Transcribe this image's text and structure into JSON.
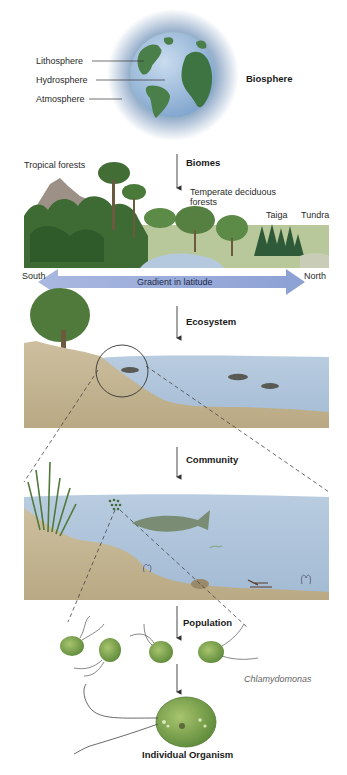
{
  "biosphere": {
    "label": "Biosphere",
    "parts": [
      {
        "label": "Lithosphere"
      },
      {
        "label": "Hydrosphere"
      },
      {
        "label": "Atmosphere"
      }
    ]
  },
  "biomes": {
    "label": "Biomes",
    "types": [
      {
        "label": "Tropical forests"
      },
      {
        "label": "Temperate deciduous forests"
      },
      {
        "label": "Taiga"
      },
      {
        "label": "Tundra"
      }
    ],
    "gradient": {
      "label": "Gradient in latitude",
      "left": "South",
      "right": "North"
    }
  },
  "ecosystem": {
    "label": "Ecosystem"
  },
  "community": {
    "label": "Community"
  },
  "population": {
    "label": "Population",
    "species": "Chlamydomonas"
  },
  "individual": {
    "label": "Individual Organism"
  },
  "colors": {
    "globe_ocean": "#8fb3d9",
    "globe_land": "#3f7a4a",
    "atmosphere_glow": "#7d9ec4",
    "gradient_arrow": "#8fa3d6",
    "water": "#b7c9de",
    "ground": "#c9b99a",
    "vegetation": "#3d6b3a",
    "organism": "#7fa34f"
  }
}
